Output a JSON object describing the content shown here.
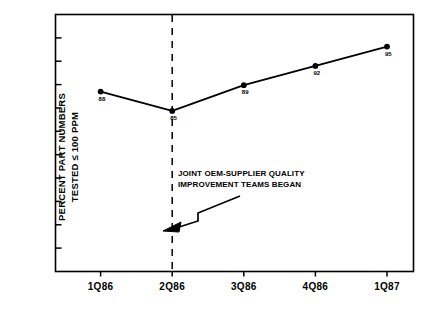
{
  "chart_data": {
    "type": "line",
    "title": "",
    "xlabel": "",
    "ylabel": "PERCENT PART NUMBERS TESTED ≤ 100 PPM",
    "ylabel_line1": "PERCENT PART NUMBERS",
    "ylabel_line2": "TESTED ≤ 100 PPM",
    "categories": [
      "1Q86",
      "2Q86",
      "3Q86",
      "4Q86",
      "1Q87"
    ],
    "values": [
      88,
      85,
      89,
      92,
      95
    ],
    "point_labels": [
      "88",
      "85",
      "89",
      "92",
      "95"
    ],
    "ylim": [
      60,
      100
    ],
    "y_tick_count": 10,
    "y_tick_labels": [],
    "grid": false,
    "legend": null,
    "series_color": "#000000",
    "marker": "filled-circle",
    "annotations": [
      {
        "name": "joint-oem-supplier-note",
        "text_line1": "JOINT OEM-SUPPLIER QUALITY",
        "text_line2": "IMPROVEMENT TEAMS BEGAN",
        "points_to": "2Q86",
        "arrow": "stepped-arrow-down-left"
      },
      {
        "name": "intervention-marker",
        "type": "vertical-dashed-line",
        "at_category": "2Q86"
      }
    ]
  },
  "colors": {
    "ink": "#000000",
    "background": "#ffffff"
  }
}
